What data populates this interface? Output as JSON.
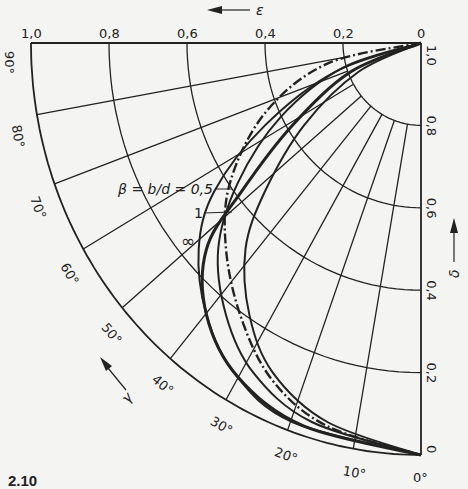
{
  "figure": {
    "caption": "2.10",
    "center": [
      421,
      43
    ],
    "radius_x": 390,
    "radius_y": 412,
    "background": "#f4f4f2",
    "ink": "#222222"
  },
  "axes": {
    "epsilon": {
      "symbol": "ε",
      "direction": "left",
      "ticks": [
        "1,0",
        "0,8",
        "0,6",
        "0,4",
        "0,2",
        "0"
      ],
      "tick_values": [
        1.0,
        0.8,
        0.6,
        0.4,
        0.2,
        0
      ]
    },
    "delta": {
      "symbol": "δ",
      "direction": "up",
      "ticks": [
        "1,0",
        "0,8",
        "0,6",
        "0,4",
        "0,2",
        "0"
      ],
      "tick_values": [
        1.0,
        0.8,
        0.6,
        0.4,
        0.2,
        0
      ]
    },
    "gamma": {
      "symbol": "γ",
      "direction": "counter-clockwise",
      "ticks": [
        "0°",
        "10°",
        "20°",
        "30°",
        "40°",
        "50°",
        "60°",
        "70°",
        "80°",
        "90°"
      ],
      "tick_values": [
        0,
        10,
        20,
        30,
        40,
        50,
        60,
        70,
        80,
        90
      ]
    }
  },
  "legend": {
    "title": "β = b/d = 0,5",
    "entries": [
      {
        "label": "β = b/d = 0,5",
        "style": "solid"
      },
      {
        "label": "1",
        "style": "dash-dot"
      },
      {
        "label": "∞",
        "style": "solid-thick"
      }
    ]
  },
  "chart_data": {
    "type": "line",
    "coordinate_system": "polar quarter-circle",
    "title": "",
    "xlabel": "ε",
    "ylabel": "δ",
    "angular_label": "γ",
    "xlim": [
      0,
      1.0
    ],
    "ylim": [
      0,
      1.0
    ],
    "angular_range_deg": [
      0,
      90
    ],
    "grid": true,
    "radial_rings": [
      0.2,
      0.4,
      0.6,
      0.8,
      1.0
    ],
    "radial_lines_deg": [
      0,
      10,
      20,
      30,
      40,
      50,
      60,
      70,
      80,
      90
    ],
    "series": [
      {
        "name": "β = 0,5",
        "style": "solid",
        "points_eps_delta": [
          [
            0,
            1.0
          ],
          [
            0.2,
            0.94
          ],
          [
            0.36,
            0.82
          ],
          [
            0.47,
            0.66
          ],
          [
            0.52,
            0.5
          ],
          [
            0.5,
            0.34
          ],
          [
            0.43,
            0.2
          ],
          [
            0.28,
            0.08
          ],
          [
            0,
            0
          ]
        ]
      },
      {
        "name": "β = 1",
        "style": "dash-dot",
        "points_eps_delta": [
          [
            0,
            1.0
          ],
          [
            0.24,
            0.95
          ],
          [
            0.4,
            0.83
          ],
          [
            0.49,
            0.66
          ],
          [
            0.5,
            0.5
          ],
          [
            0.46,
            0.33
          ],
          [
            0.38,
            0.18
          ],
          [
            0.24,
            0.07
          ],
          [
            0,
            0
          ]
        ]
      },
      {
        "name": "β = ∞",
        "style": "solid-thick",
        "points_eps_delta": [
          [
            0,
            1.0
          ],
          [
            0.18,
            0.93
          ],
          [
            0.33,
            0.8
          ],
          [
            0.46,
            0.64
          ],
          [
            0.55,
            0.5
          ],
          [
            0.55,
            0.34
          ],
          [
            0.47,
            0.19
          ],
          [
            0.3,
            0.07
          ],
          [
            0,
            0
          ]
        ]
      },
      {
        "name": "outer envelope",
        "style": "solid",
        "points_eps_delta": [
          [
            0,
            1.0
          ],
          [
            0.22,
            0.93
          ],
          [
            0.4,
            0.8
          ],
          [
            0.53,
            0.64
          ],
          [
            0.57,
            0.5
          ],
          [
            0.55,
            0.34
          ],
          [
            0.48,
            0.2
          ],
          [
            0.33,
            0.08
          ],
          [
            0,
            0
          ]
        ]
      },
      {
        "name": "inner envelope",
        "style": "solid",
        "points_eps_delta": [
          [
            0,
            1.0
          ],
          [
            0.16,
            0.93
          ],
          [
            0.3,
            0.8
          ],
          [
            0.4,
            0.64
          ],
          [
            0.45,
            0.5
          ],
          [
            0.44,
            0.34
          ],
          [
            0.38,
            0.2
          ],
          [
            0.24,
            0.08
          ],
          [
            0,
            0
          ]
        ]
      }
    ]
  }
}
